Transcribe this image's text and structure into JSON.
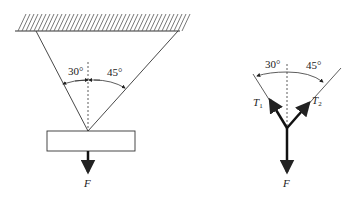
{
  "left_panel": {
    "angle_left": "30°",
    "angle_right": "45°",
    "force_label": "F"
  },
  "right_panel": {
    "angle_left": "30°",
    "angle_right": "45°",
    "tension1_label": "T",
    "tension1_sub": "1",
    "tension2_label": "T",
    "tension2_sub": "2",
    "force_label": "F"
  },
  "colors": {
    "line": "#333333",
    "hatch": "#555555"
  }
}
